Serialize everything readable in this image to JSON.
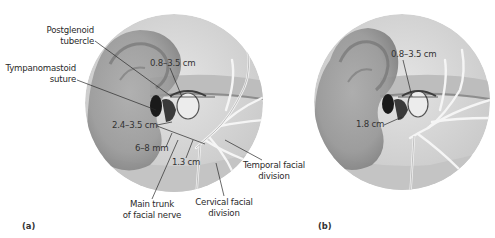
{
  "figure": {
    "panels": [
      {
        "id": "a",
        "panel_label": "(a)",
        "labels": {
          "postglenoid_line1": "Postglenoid",
          "postglenoid_line2": "tubercle",
          "tympanomastoid_line1": "Tympanomastoid",
          "tympanomastoid_line2": "suture",
          "main_trunk_line1": "Main trunk",
          "main_trunk_line2": "of facial nerve",
          "cervical_line1": "Cervical facial",
          "cervical_line2": "division",
          "temporal_line1": "Temporal facial",
          "temporal_line2": "division"
        },
        "measurements": {
          "tragus_to_nerve": "0.8–3.5 cm",
          "suture_distance": "2.4–3.5 cm",
          "depth": "6–8 mm",
          "bifurcation": "1.3 cm"
        }
      },
      {
        "id": "b",
        "panel_label": "(b)",
        "measurements": {
          "tragus_to_nerve": "0.8–3.5 cm",
          "canal_distance": "1.8 cm"
        }
      }
    ],
    "colors": {
      "background": "#ffffff",
      "circle_bg": "#d9d9d9",
      "skin": "#bdbdbd",
      "ear_shadow": "#8a8a8a",
      "nerve": "#f2f2f2",
      "leader_line": "#2a2a2a",
      "text": "#2a2a2a"
    }
  }
}
